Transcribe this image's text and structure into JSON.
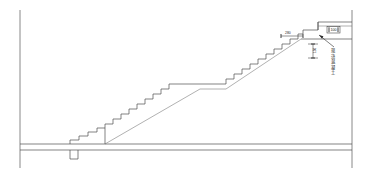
{
  "drawing": {
    "kind": "architectural-section",
    "subject": "staircase-section",
    "background_color": "#ffffff",
    "line_color": "#4d4d4d",
    "border_color": "#6a6a6a",
    "annotation_color": "#1c1c1c",
    "canvas": {
      "width": 368,
      "height": 180
    }
  },
  "annotations": {
    "run_dimension": {
      "name": "top-run-dimension",
      "text": "280",
      "x": 289,
      "y": 33
    },
    "riser_dimension": {
      "name": "landing-height-dimension",
      "text": "150",
      "x": 316,
      "y": 50
    },
    "slab_dimension": {
      "name": "slab-thickness-dimension",
      "text": "100",
      "x": 334,
      "y": 31
    },
    "leader_label": {
      "name": "landing-slab-note",
      "characters": [
        "现",
        "浇",
        "混",
        "凝",
        "土"
      ],
      "x": 333,
      "y": 50
    }
  },
  "geometry": {
    "border": {
      "left_x": 20,
      "right_x": 352,
      "top_y": 10,
      "bottom_y": 168
    },
    "ground": {
      "upper_y": 144,
      "lower_y": 150,
      "left_x": 20,
      "right_x": 352
    },
    "pit": {
      "left_x": 70,
      "right_x": 78,
      "top_y": 150,
      "bottom_y": 159
    },
    "lower_steps": {
      "start_x": 70,
      "start_y": 144,
      "end_x": 105,
      "end_y": 130,
      "count": 4
    },
    "stringer_x": 105,
    "main_run": {
      "from_x": 105,
      "from_y": 141,
      "to_x": 300,
      "to_y": 32,
      "step_count": 24
    },
    "mid_landing": {
      "left_x": 199,
      "right_x": 226,
      "y": 84
    },
    "top_landing": {
      "left_x": 300,
      "right_x": 352,
      "top_y": 22,
      "slab_y": 32
    }
  }
}
